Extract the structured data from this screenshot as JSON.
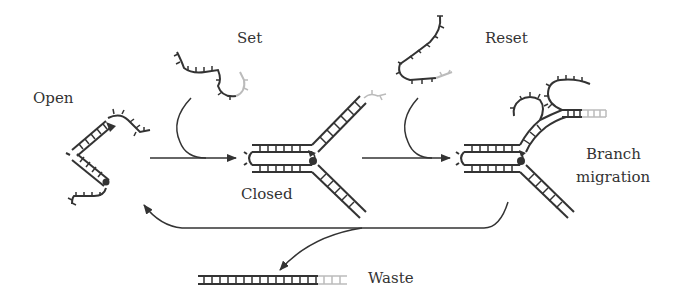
{
  "labels": {
    "open": "Open",
    "set": "Set",
    "closed": "Closed",
    "reset": "Reset",
    "branch_migration_line1": "Branch",
    "branch_migration_line2": "migration",
    "waste": "Waste"
  },
  "colors": {
    "ink": "#333333",
    "faded": "#bbbbbb",
    "background": "#ffffff"
  }
}
